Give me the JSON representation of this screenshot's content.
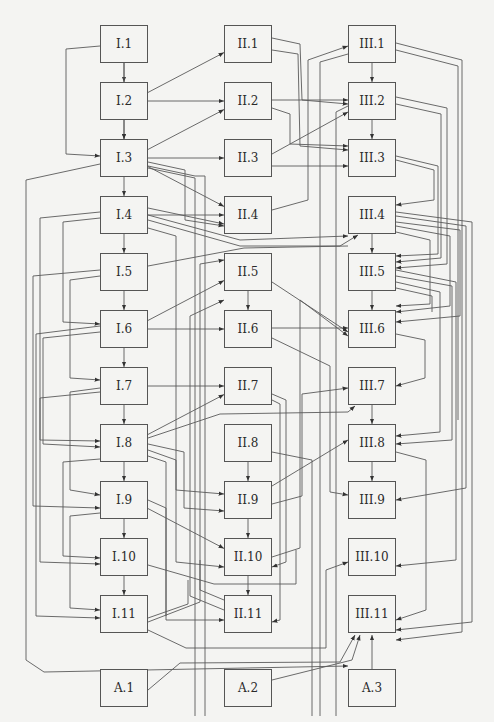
{
  "diagram": {
    "type": "directed-graph",
    "columns": [
      {
        "id": "I",
        "x": 100,
        "nodes": [
          {
            "id": "I.1",
            "label": "I.1",
            "row": 0
          },
          {
            "id": "I.2",
            "label": "I.2",
            "row": 1
          },
          {
            "id": "I.3",
            "label": "I.3",
            "row": 2
          },
          {
            "id": "I.4",
            "label": "I.4",
            "row": 3
          },
          {
            "id": "I.5",
            "label": "I.5",
            "row": 4
          },
          {
            "id": "I.6",
            "label": "I.6",
            "row": 5
          },
          {
            "id": "I.7",
            "label": "I.7",
            "row": 6
          },
          {
            "id": "I.8",
            "label": "I.8",
            "row": 7
          },
          {
            "id": "I.9",
            "label": "I.9",
            "row": 8
          },
          {
            "id": "I.10",
            "label": "I.10",
            "row": 9
          },
          {
            "id": "I.11",
            "label": "I.11",
            "row": 10
          }
        ]
      },
      {
        "id": "II",
        "x": 224,
        "nodes": [
          {
            "id": "II.1",
            "label": "II.1",
            "row": 0
          },
          {
            "id": "II.2",
            "label": "II.2",
            "row": 1
          },
          {
            "id": "II.3",
            "label": "II.3",
            "row": 2
          },
          {
            "id": "II.4",
            "label": "II.4",
            "row": 3
          },
          {
            "id": "II.5",
            "label": "II.5",
            "row": 4
          },
          {
            "id": "II.6",
            "label": "II.6",
            "row": 5
          },
          {
            "id": "II.7",
            "label": "II.7",
            "row": 6
          },
          {
            "id": "II.8",
            "label": "II.8",
            "row": 7
          },
          {
            "id": "II.9",
            "label": "II.9",
            "row": 8
          },
          {
            "id": "II.10",
            "label": "II.10",
            "row": 9
          },
          {
            "id": "II.11",
            "label": "II.11",
            "row": 10
          }
        ]
      },
      {
        "id": "III",
        "x": 348,
        "nodes": [
          {
            "id": "III.1",
            "label": "III.1",
            "row": 0
          },
          {
            "id": "III.2",
            "label": "III.2",
            "row": 1
          },
          {
            "id": "III.3",
            "label": "III.3",
            "row": 2
          },
          {
            "id": "III.4",
            "label": "III.4",
            "row": 3
          },
          {
            "id": "III.5",
            "label": "III.5",
            "row": 4
          },
          {
            "id": "III.6",
            "label": "III.6",
            "row": 5
          },
          {
            "id": "III.7",
            "label": "III.7",
            "row": 6
          },
          {
            "id": "III.8",
            "label": "III.8",
            "row": 7
          },
          {
            "id": "III.9",
            "label": "III.9",
            "row": 8
          },
          {
            "id": "III.10",
            "label": "III.10",
            "row": 9
          },
          {
            "id": "III.11",
            "label": "III.11",
            "row": 10
          }
        ]
      }
    ],
    "sources": [
      {
        "id": "A.1",
        "label": "A.1",
        "x": 100
      },
      {
        "id": "A.2",
        "label": "A.2",
        "x": 224
      },
      {
        "id": "A.3",
        "label": "A.3",
        "x": 348
      }
    ],
    "edges": [
      [
        "I.1",
        "I.2"
      ],
      [
        "I.2",
        "I.3"
      ],
      [
        "I.3",
        "I.4"
      ],
      [
        "I.4",
        "I.5"
      ],
      [
        "I.5",
        "I.6"
      ],
      [
        "I.6",
        "I.7"
      ],
      [
        "I.7",
        "I.8"
      ],
      [
        "I.8",
        "I.9"
      ],
      [
        "I.9",
        "I.10"
      ],
      [
        "I.10",
        "I.11"
      ],
      [
        "II.5",
        "II.6"
      ],
      [
        "II.8",
        "II.9"
      ],
      [
        "II.9",
        "II.10"
      ],
      [
        "II.10",
        "II.11"
      ],
      [
        "III.1",
        "III.2"
      ],
      [
        "III.2",
        "III.3"
      ],
      [
        "III.4",
        "III.5"
      ],
      [
        "III.5",
        "III.6"
      ],
      [
        "III.7",
        "III.8"
      ],
      [
        "III.8",
        "III.9"
      ],
      [
        "I.1",
        "I.3"
      ],
      [
        "I.2",
        "II.1"
      ],
      [
        "I.2",
        "II.2"
      ],
      [
        "I.3",
        "II.1"
      ],
      [
        "I.3",
        "II.2"
      ],
      [
        "I.3",
        "II.3"
      ],
      [
        "I.3",
        "II.4"
      ],
      [
        "I.4",
        "II.4"
      ],
      [
        "I.6",
        "II.5"
      ],
      [
        "I.6",
        "II.6"
      ],
      [
        "I.7",
        "II.7"
      ],
      [
        "I.8",
        "II.7"
      ],
      [
        "I.9",
        "II.10"
      ],
      [
        "II.1",
        "III.2"
      ],
      [
        "II.1",
        "III.3"
      ],
      [
        "II.2",
        "III.2"
      ],
      [
        "II.2",
        "III.3"
      ],
      [
        "II.3",
        "III.2"
      ],
      [
        "II.3",
        "III.3"
      ],
      [
        "II.4",
        "III.1"
      ],
      [
        "II.5",
        "III.6"
      ],
      [
        "II.6",
        "III.6"
      ],
      [
        "II.9",
        "III.8"
      ],
      [
        "A.3",
        "III.11"
      ],
      [
        "A.2",
        "III.11"
      ],
      [
        "A.1",
        "III.11"
      ]
    ]
  }
}
